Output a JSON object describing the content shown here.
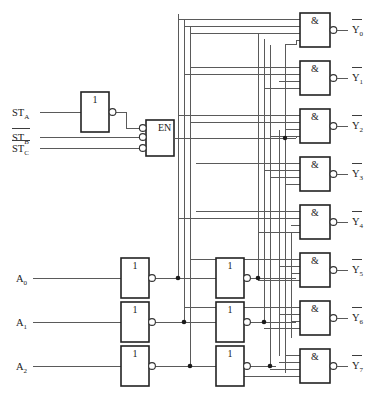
{
  "diagram": {
    "enable_label": "EN",
    "and_gate_symbol": "&",
    "inverter_symbol": "1",
    "overbar_char": "‾"
  },
  "inputs": {
    "select": [
      {
        "name": "A0",
        "base": "A",
        "sub": "0",
        "inverted": false
      },
      {
        "name": "A1",
        "base": "A",
        "sub": "1",
        "inverted": false
      },
      {
        "name": "A2",
        "base": "A",
        "sub": "2",
        "inverted": false
      }
    ],
    "strobe": [
      {
        "name": "STA",
        "base": "ST",
        "sub": "A",
        "inverted": false
      },
      {
        "name": "STB",
        "base": "ST",
        "sub": "B",
        "inverted": true
      },
      {
        "name": "STC",
        "base": "ST",
        "sub": "C",
        "inverted": true
      }
    ]
  },
  "outputs": [
    {
      "base": "Y",
      "sub": "0",
      "inverted": true
    },
    {
      "base": "Y",
      "sub": "1",
      "inverted": true
    },
    {
      "base": "Y",
      "sub": "2",
      "inverted": true
    },
    {
      "base": "Y",
      "sub": "3",
      "inverted": true
    },
    {
      "base": "Y",
      "sub": "4",
      "inverted": true
    },
    {
      "base": "Y",
      "sub": "5",
      "inverted": true
    },
    {
      "base": "Y",
      "sub": "6",
      "inverted": true
    },
    {
      "base": "Y",
      "sub": "7",
      "inverted": true
    }
  ],
  "gates": {
    "output_and_count": 8,
    "output_and_inputs": 4,
    "first_stage_inverters": 3,
    "second_stage_inverters": 3,
    "enable_gate_inputs": 3,
    "enable_gate_inverted_inputs": 3,
    "strobe_inverters": 1
  },
  "colors": {
    "wire": "#5a5a5a",
    "gate_outline": "#222222",
    "background": "#ffffff",
    "text": "#1a1a1a",
    "junction": "#1a1a1a"
  }
}
